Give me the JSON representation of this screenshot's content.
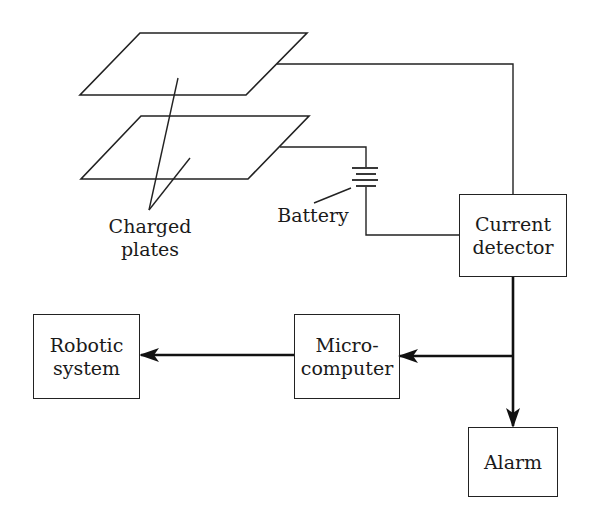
{
  "diagram": {
    "type": "block-diagram",
    "labels": {
      "charged_plates": [
        "Charged",
        "plates"
      ],
      "battery": "Battery"
    },
    "blocks": {
      "current_detector": [
        "Current",
        "detector"
      ],
      "robotic_system": [
        "Robotic",
        "system"
      ],
      "microcomputer": [
        "Micro-",
        "computer"
      ],
      "alarm": "Alarm"
    },
    "connections": [
      {
        "from": "upper-plate",
        "to": "current_detector",
        "style": "thin"
      },
      {
        "from": "lower-plate",
        "to": "battery",
        "style": "thin"
      },
      {
        "from": "battery",
        "to": "current_detector",
        "style": "thin"
      },
      {
        "from": "current_detector",
        "to": "microcomputer",
        "style": "arrow"
      },
      {
        "from": "current_detector",
        "to": "alarm",
        "style": "arrow"
      },
      {
        "from": "microcomputer",
        "to": "robotic_system",
        "style": "arrow"
      }
    ],
    "colors": {
      "line": "#222222",
      "background": "#ffffff"
    }
  }
}
